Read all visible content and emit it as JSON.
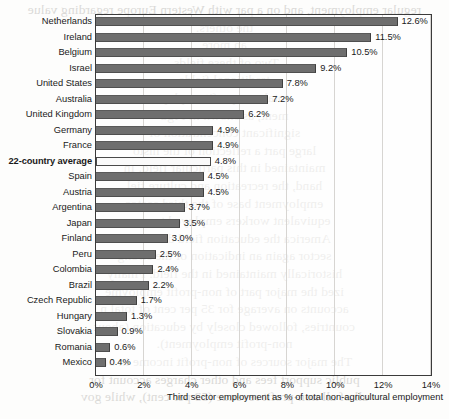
{
  "chart_data": {
    "type": "bar",
    "orientation": "horizontal",
    "title": "",
    "xlabel": "Third sector employment as % of total non-agricultural employment",
    "ylabel": "",
    "xlim": [
      0,
      14
    ],
    "xticks": [
      "0%",
      "2%",
      "4%",
      "6%",
      "8%",
      "10%",
      "12%",
      "14%"
    ],
    "xtick_values": [
      0,
      2,
      4,
      6,
      8,
      10,
      12,
      14
    ],
    "grid": true,
    "legend": "none",
    "value_suffix": "%",
    "categories": [
      "Netherlands",
      "Ireland",
      "Belgium",
      "Israel",
      "United States",
      "Australia",
      "United Kingdom",
      "Germany",
      "France",
      "22-country average",
      "Spain",
      "Austria",
      "Argentina",
      "Japan",
      "Finland",
      "Peru",
      "Colombia",
      "Brazil",
      "Czech Republic",
      "Hungary",
      "Slovakia",
      "Romania",
      "Mexico"
    ],
    "values": [
      12.6,
      11.5,
      10.5,
      9.2,
      7.8,
      7.2,
      6.2,
      4.9,
      4.9,
      4.8,
      4.5,
      4.5,
      3.7,
      3.5,
      3.0,
      2.5,
      2.4,
      2.2,
      1.7,
      1.3,
      0.9,
      0.6,
      0.4
    ],
    "value_labels": [
      "12.6%",
      "11.5%",
      "10.5%",
      "9.2%",
      "7.8%",
      "7.2%",
      "6.2%",
      "4.9%",
      "4.9%",
      "4.8%",
      "4.5%",
      "4.5%",
      "3.7%",
      "3.5%",
      "3.0%",
      "2.5%",
      "2.4%",
      "2.2%",
      "1.7%",
      "1.3%",
      "0.9%",
      "0.6%",
      "0.4%"
    ],
    "highlight_index": 9,
    "highlight_label": "22-country average",
    "colors": {
      "bar": "#6e6e6e",
      "highlight_bar": "#fafafa",
      "highlight_bar_border": "#4a4a4a",
      "frame": "#3b3b3b",
      "gridline": "#d7d5d2",
      "text": "#1a1a1a",
      "background": "#fdfdfc"
    }
  },
  "background_text": {
    "lines": [
      "regular employment, and on a par with Western Europe regarding value",
      "the others. ",
      "an more",
      "Two of these fields. ",
      "traditional fields ",
      "total non-profit employ",
      "ment, as shown in Figu",
      "significant concentration of",
      "large part a reflection of the histo",
      "maintained in this particular field. In",
      "hand, the recreation and culture fiel",
      "employment base of the third sector",
      "equivalent workers employed to non-p",
      "America the education field dominates",
      "sector again an indication of the strong",
      "historically maintained in the field. Finally",
      "ized the major part of non-profit employme",
      "accounts on average for 35 per cent of total n",
      "countries, followed closely by education (about",
      "non-profit employment).",
      "The major sources of non-profit income in our",
      "public support fees and other charges account for",
      "all of all non-profit revenue (53 per cent), while gov"
    ]
  }
}
